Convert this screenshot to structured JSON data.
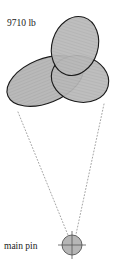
{
  "diagram": {
    "background_color": "#ffffff",
    "labels": {
      "load_label": "9710 lb",
      "pin_label": "main pin"
    },
    "colors": {
      "ellipse_fill": "#b6b6b6",
      "ellipse_stroke": "#1a1a1a",
      "pin_fill": "#b6b6b6",
      "pin_stroke": "#555555",
      "dotted_line": "#9a9a9a",
      "text": "#1a1a1a"
    },
    "load_zones": [
      {
        "name": "top-ellipse",
        "cx": 75,
        "cy": 46,
        "rx": 23,
        "ry": 30,
        "rotation": 17
      },
      {
        "name": "left-ellipse",
        "cx": 45,
        "cy": 81,
        "rx": 40,
        "ry": 22,
        "rotation": -22
      },
      {
        "name": "right-ellipse",
        "cx": 80,
        "cy": 79,
        "rx": 29,
        "ry": 23,
        "rotation": 14
      }
    ],
    "main_pin": {
      "cx": 72,
      "cy": 245,
      "r": 10,
      "crosshair_overhang": 4
    },
    "guide_lines": [
      {
        "name": "left-guide",
        "x1": 18,
        "y1": 112,
        "x2": 70,
        "y2": 240
      },
      {
        "name": "right-guide",
        "x1": 104,
        "y1": 104,
        "x2": 75,
        "y2": 239
      }
    ],
    "label_positions": {
      "load_label": {
        "x": 7,
        "y": 26
      },
      "pin_label": {
        "x": 4,
        "y": 249
      }
    }
  }
}
